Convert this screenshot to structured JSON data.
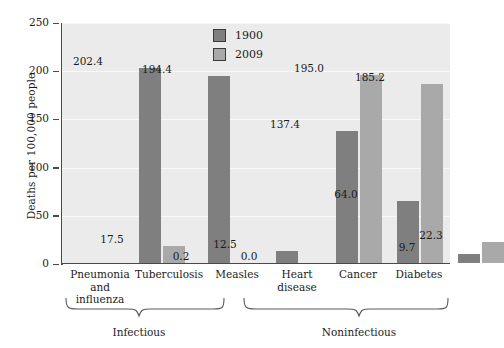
{
  "chart_data": {
    "type": "bar",
    "title": "",
    "xlabel": "",
    "ylabel": "Deaths per 100,000 people",
    "ylim": [
      0,
      250
    ],
    "yticks": [
      0,
      50,
      100,
      150,
      200,
      250
    ],
    "ytick_labels": [
      "0",
      "50",
      "100",
      "150",
      "200",
      "250"
    ],
    "grid": true,
    "legend_position": "top-right",
    "categories": [
      "Pneumonia and influenza",
      "Tuberculosis",
      "Measles",
      "Heart disease",
      "Cancer",
      "Diabetes"
    ],
    "category_lines": [
      [
        "Pneumonia",
        "and",
        "influenza"
      ],
      [
        "Tuberculosis"
      ],
      [
        "Measles"
      ],
      [
        "Heart",
        "disease"
      ],
      [
        "Cancer"
      ],
      [
        "Diabetes"
      ]
    ],
    "series": [
      {
        "name": "1900",
        "color": "#7f7f7f",
        "values": [
          202.4,
          194.4,
          12.5,
          137.4,
          64.0,
          9.7
        ],
        "value_labels": [
          "202.4",
          "194.4",
          "12.5",
          "137.4",
          "64.0",
          "9.7"
        ]
      },
      {
        "name": "2009",
        "color": "#a9a9a9",
        "values": [
          17.5,
          0.2,
          0.0,
          195.0,
          185.2,
          22.3
        ],
        "value_labels": [
          "17.5",
          "0.2",
          "0.0",
          "195.0",
          "185.2",
          "22.3"
        ]
      }
    ],
    "groups": [
      {
        "label": "Infectious",
        "categories": [
          "Pneumonia and influenza",
          "Tuberculosis",
          "Measles"
        ]
      },
      {
        "label": "Noninfectious",
        "categories": [
          "Heart disease",
          "Cancer",
          "Diabetes"
        ]
      }
    ],
    "colors": {
      "series_1900": "#7f7f7f",
      "series_2009": "#a9a9a9",
      "plot_background": "#ebebeb",
      "axis": "#4a4a4a",
      "gridline": "#f8f8f8",
      "text": "#1b1b1b"
    }
  }
}
